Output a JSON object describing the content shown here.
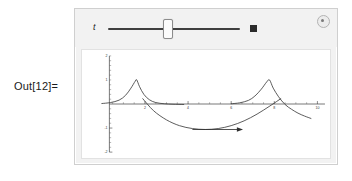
{
  "notebook": {
    "out_label": "Out[12]="
  },
  "manipulate": {
    "control": {
      "slider_label": "t",
      "slider_value_fraction": 0.45,
      "animate_button_name": "animate",
      "options_icon": "gear-circle-icon"
    },
    "colors": {
      "panel_bg": "#f2f2f2",
      "plot_bg": "#ffffff",
      "frame_border": "#cfcfcf",
      "curve": "#3d3d3d",
      "axis": "#3a3a3a"
    }
  },
  "chart_data": {
    "type": "line",
    "title": "",
    "xlabel": "",
    "ylabel": "",
    "xlim": [
      0,
      10.4
    ],
    "ylim": [
      -2,
      2
    ],
    "grid": false,
    "legend": null,
    "xticks": [
      2,
      4,
      6,
      8,
      10
    ],
    "xtick_labels": [
      "2",
      "4",
      "6",
      "8",
      "10"
    ],
    "yticks": [
      -2,
      -1,
      1,
      2
    ],
    "ytick_labels": [
      "-2",
      "-1",
      "1",
      "2"
    ],
    "series": [
      {
        "name": "pulse-1",
        "description": "cusp peak rising to 1 and decaying",
        "x": [
          0.0,
          0.4,
          0.8,
          1.1,
          1.35,
          1.55,
          1.62,
          1.75,
          1.95,
          2.2,
          2.5,
          2.9,
          3.3,
          3.8
        ],
        "y": [
          0.02,
          0.06,
          0.16,
          0.36,
          0.66,
          0.95,
          1.0,
          0.72,
          0.4,
          0.18,
          0.06,
          0.01,
          -0.01,
          -0.02
        ]
      },
      {
        "name": "pulse-2",
        "description": "cusp peak rising to 1 and decaying, second period",
        "x": [
          6.0,
          6.4,
          6.8,
          7.1,
          7.4,
          7.65,
          7.78,
          7.95,
          8.2,
          8.5,
          8.8,
          9.1,
          9.4,
          9.7
        ],
        "y": [
          0.01,
          0.05,
          0.15,
          0.33,
          0.62,
          0.92,
          1.0,
          0.66,
          0.3,
          -0.02,
          -0.22,
          -0.38,
          -0.5,
          -0.6
        ]
      },
      {
        "name": "dip-curve",
        "description": "downward parabola-like curve ending with arrowhead",
        "x": [
          1.9,
          2.4,
          3.0,
          3.6,
          4.2,
          4.8,
          5.4,
          6.0,
          6.6,
          7.2,
          7.8,
          8.3
        ],
        "y": [
          0.22,
          -0.28,
          -0.66,
          -0.9,
          -1.02,
          -1.06,
          -1.02,
          -0.9,
          -0.7,
          -0.42,
          -0.08,
          0.22
        ]
      },
      {
        "name": "arrow",
        "description": "horizontal arrow pointing right at y = -1.05",
        "x": [
          4.2,
          6.55
        ],
        "y": [
          -1.06,
          -1.06
        ],
        "arrowhead": "right"
      }
    ]
  }
}
